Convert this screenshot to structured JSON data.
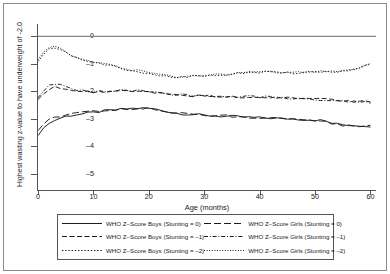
{
  "chart_data": {
    "type": "line",
    "title": "",
    "xlabel": "Age (months)",
    "ylabel": "Highest wasting z-value to have underweight of -2.0",
    "xlim": [
      0,
      61
    ],
    "ylim": [
      -5.6,
      0.45
    ],
    "xticks": [
      0,
      10,
      20,
      30,
      40,
      50,
      60
    ],
    "yticks": [
      0,
      -1,
      -2,
      -3,
      -4,
      -5
    ],
    "ytick_labels": [
      "0",
      "-1",
      "-2",
      "-3",
      "-4",
      "-5"
    ],
    "xtick_labels": [
      "0",
      "10",
      "20",
      "30",
      "40",
      "50",
      "60"
    ],
    "grid": false,
    "legend_position": "bottom",
    "zero_reference_line": 0,
    "x": [
      0,
      1,
      2,
      3,
      4,
      5,
      6,
      7,
      8,
      9,
      10,
      11,
      12,
      13,
      14,
      15,
      16,
      17,
      18,
      19,
      20,
      21,
      22,
      23,
      24,
      25,
      26,
      27,
      28,
      29,
      30,
      31,
      32,
      33,
      34,
      35,
      36,
      37,
      38,
      39,
      40,
      41,
      42,
      43,
      44,
      45,
      46,
      47,
      48,
      49,
      50,
      51,
      52,
      53,
      54,
      55,
      56,
      57,
      58,
      59,
      60
    ],
    "series": [
      {
        "name": "WHO Z-Score Boys (Stunting = 0)",
        "style": "solid",
        "color": "#1a1a1a",
        "values": [
          -3.62,
          -3.34,
          -3.18,
          -3.06,
          -2.98,
          -2.92,
          -2.88,
          -2.85,
          -2.83,
          -2.8,
          -2.78,
          -2.75,
          -2.72,
          -2.7,
          -2.68,
          -2.66,
          -2.64,
          -2.63,
          -2.62,
          -2.62,
          -2.63,
          -2.65,
          -2.68,
          -2.72,
          -2.77,
          -2.8,
          -2.82,
          -2.84,
          -2.85,
          -2.86,
          -2.88,
          -2.89,
          -2.9,
          -2.91,
          -2.92,
          -2.92,
          -2.93,
          -2.94,
          -2.95,
          -2.96,
          -2.97,
          -2.97,
          -2.98,
          -2.99,
          -3.0,
          -3.0,
          -3.01,
          -3.02,
          -3.03,
          -3.04,
          -3.05,
          -3.06,
          -3.1,
          -3.16,
          -3.2,
          -3.22,
          -3.23,
          -3.24,
          -3.25,
          -3.26,
          -3.27
        ]
      },
      {
        "name": "WHO Z-Score Boys (Stunting = -1)",
        "style": "dashed",
        "color": "#1a1a1a",
        "values": [
          -2.3,
          -2.1,
          -1.92,
          -1.86,
          -1.88,
          -1.92,
          -1.96,
          -1.99,
          -2.01,
          -2.02,
          -2.02,
          -2.02,
          -2.01,
          -2.0,
          -1.99,
          -1.98,
          -1.98,
          -1.99,
          -2.0,
          -2.02,
          -2.04,
          -2.06,
          -2.08,
          -2.1,
          -2.12,
          -2.13,
          -2.14,
          -2.15,
          -2.16,
          -2.16,
          -2.17,
          -2.17,
          -2.18,
          -2.18,
          -2.19,
          -2.19,
          -2.2,
          -2.2,
          -2.21,
          -2.21,
          -2.22,
          -2.22,
          -2.23,
          -2.23,
          -2.24,
          -2.24,
          -2.25,
          -2.26,
          -2.27,
          -2.28,
          -2.29,
          -2.3,
          -2.31,
          -2.33,
          -2.35,
          -2.36,
          -2.37,
          -2.37,
          -2.38,
          -2.38,
          -2.39
        ]
      },
      {
        "name": "WHO Z-Score Boys (Stunting = -2)",
        "style": "dotted",
        "color": "#1a1a1a",
        "values": [
          -0.92,
          -0.66,
          -0.46,
          -0.42,
          -0.5,
          -0.6,
          -0.7,
          -0.78,
          -0.85,
          -0.91,
          -0.96,
          -1.0,
          -1.04,
          -1.08,
          -1.12,
          -1.16,
          -1.2,
          -1.24,
          -1.28,
          -1.32,
          -1.36,
          -1.4,
          -1.43,
          -1.45,
          -1.47,
          -1.48,
          -1.48,
          -1.47,
          -1.45,
          -1.44,
          -1.43,
          -1.42,
          -1.41,
          -1.4,
          -1.39,
          -1.38,
          -1.36,
          -1.34,
          -1.32,
          -1.31,
          -1.3,
          -1.3,
          -1.3,
          -1.3,
          -1.31,
          -1.32,
          -1.33,
          -1.33,
          -1.33,
          -1.32,
          -1.31,
          -1.3,
          -1.29,
          -1.28,
          -1.27,
          -1.26,
          -1.24,
          -1.2,
          -1.14,
          -1.08,
          -1.02
        ]
      },
      {
        "name": "WHO Z-Score Girls (Stunting = 0)",
        "style": "longdash",
        "color": "#1a1a1a",
        "values": [
          -3.44,
          -3.2,
          -3.04,
          -2.95,
          -2.9,
          -2.86,
          -2.83,
          -2.81,
          -2.79,
          -2.77,
          -2.75,
          -2.73,
          -2.71,
          -2.69,
          -2.67,
          -2.65,
          -2.64,
          -2.63,
          -2.62,
          -2.62,
          -2.63,
          -2.66,
          -2.7,
          -2.74,
          -2.78,
          -2.8,
          -2.82,
          -2.83,
          -2.84,
          -2.85,
          -2.86,
          -2.87,
          -2.88,
          -2.89,
          -2.9,
          -2.91,
          -2.92,
          -2.93,
          -2.94,
          -2.95,
          -2.96,
          -2.96,
          -2.97,
          -2.98,
          -2.99,
          -3.0,
          -3.01,
          -3.02,
          -3.03,
          -3.04,
          -3.05,
          -3.06,
          -3.11,
          -3.17,
          -3.21,
          -3.23,
          -3.24,
          -3.25,
          -3.26,
          -3.27,
          -3.28
        ]
      },
      {
        "name": "WHO Z-Score Girls (Stunting = -1)",
        "style": "dashdot",
        "color": "#1a1a1a",
        "values": [
          -2.24,
          -2.0,
          -1.8,
          -1.74,
          -1.78,
          -1.84,
          -1.9,
          -1.94,
          -1.97,
          -1.99,
          -2.0,
          -2.0,
          -2.0,
          -1.99,
          -1.98,
          -1.97,
          -1.97,
          -1.98,
          -1.99,
          -2.01,
          -2.03,
          -2.05,
          -2.07,
          -2.09,
          -2.11,
          -2.12,
          -2.13,
          -2.14,
          -2.15,
          -2.15,
          -2.16,
          -2.16,
          -2.17,
          -2.17,
          -2.18,
          -2.18,
          -2.19,
          -2.19,
          -2.2,
          -2.2,
          -2.21,
          -2.21,
          -2.22,
          -2.22,
          -2.23,
          -2.24,
          -2.25,
          -2.26,
          -2.27,
          -2.28,
          -2.29,
          -2.3,
          -2.32,
          -2.34,
          -2.36,
          -2.37,
          -2.38,
          -2.38,
          -2.39,
          -2.39,
          -2.4
        ]
      },
      {
        "name": "WHO Z-Score Girls (Stunting = -2)",
        "style": "finedot",
        "color": "#1a1a1a",
        "values": [
          -0.86,
          -0.58,
          -0.38,
          -0.36,
          -0.46,
          -0.56,
          -0.66,
          -0.74,
          -0.81,
          -0.87,
          -0.92,
          -0.97,
          -1.01,
          -1.05,
          -1.09,
          -1.13,
          -1.17,
          -1.21,
          -1.25,
          -1.29,
          -1.33,
          -1.37,
          -1.4,
          -1.43,
          -1.45,
          -1.46,
          -1.46,
          -1.45,
          -1.44,
          -1.43,
          -1.42,
          -1.41,
          -1.4,
          -1.39,
          -1.38,
          -1.37,
          -1.35,
          -1.33,
          -1.31,
          -1.3,
          -1.29,
          -1.29,
          -1.29,
          -1.3,
          -1.31,
          -1.32,
          -1.32,
          -1.32,
          -1.32,
          -1.31,
          -1.3,
          -1.29,
          -1.28,
          -1.27,
          -1.26,
          -1.25,
          -1.23,
          -1.19,
          -1.13,
          -1.07,
          -1.01
        ]
      }
    ]
  },
  "legend": {
    "entries": [
      {
        "label": "WHO Z-Score Boys (Stunting = 0)",
        "style": "solid"
      },
      {
        "label": "WHO Z-Score Girls (Stunting = 0)",
        "style": "longdash"
      },
      {
        "label": "WHO Z-Score Boys (Stunting = -1)",
        "style": "dashed"
      },
      {
        "label": "WHO Z-Score Girls (Stunting = -1)",
        "style": "dashdot"
      },
      {
        "label": "WHO Z-Score Boys (Stunting = -2)",
        "style": "dotted"
      },
      {
        "label": "WHO Z-Score Girls (Stunting = -2)",
        "style": "finedot"
      }
    ]
  },
  "colors": {
    "line": "#1a1a1a",
    "axis": "#555555",
    "reference": "#888888",
    "background": "#ffffff"
  }
}
